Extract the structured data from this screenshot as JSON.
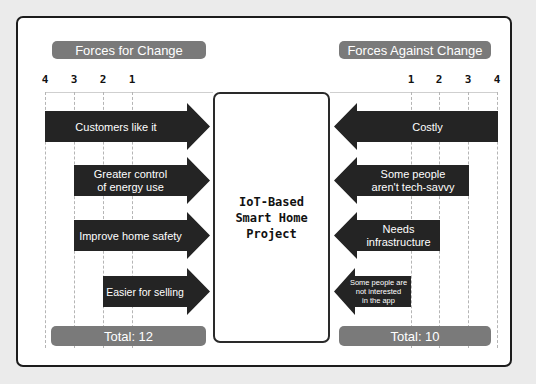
{
  "title": "IoT-Based Smart Home Project",
  "center": {
    "line1": "IoT-Based",
    "line2": "Smart Home",
    "line3": "Project"
  },
  "left": {
    "header": "Forces for Change",
    "scale": [
      "4",
      "3",
      "2",
      "1"
    ],
    "forces": [
      {
        "label": "Customers like it",
        "score": 4
      },
      {
        "label": "Greater control of energy use",
        "line1": "Greater control",
        "line2": "of energy use",
        "score": 3
      },
      {
        "label": "Improve home safety",
        "score": 3
      },
      {
        "label": "Easier for selling",
        "score": 2
      }
    ],
    "total": "Total: 12"
  },
  "right": {
    "header": "Forces Against Change",
    "scale": [
      "1",
      "2",
      "3",
      "4"
    ],
    "forces": [
      {
        "label": "Costly",
        "score": 4
      },
      {
        "label": "Some people aren't tech-savvy",
        "line1": "Some people",
        "line2": "aren't tech-savvy",
        "score": 3
      },
      {
        "label": "Needs infrastructure",
        "line1": "Needs",
        "line2": "infrastructure",
        "score": 2
      },
      {
        "label": "Some people are not interested in the app",
        "line1": "Some people are",
        "line2": "not interested",
        "line3": "in the app",
        "score": 1
      }
    ],
    "total": "Total: 10"
  },
  "colors": {
    "arrow": "#242424",
    "pill": "#7a7a7a",
    "border": "#1c1c1c",
    "background": "#ebebeb"
  }
}
